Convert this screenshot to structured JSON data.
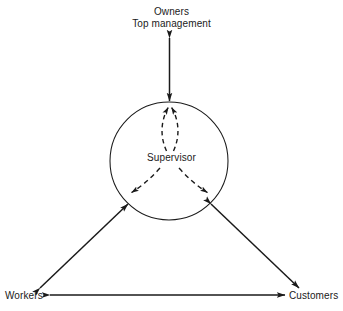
{
  "diagram": {
    "type": "relationship-diagram",
    "background_color": "#ffffff",
    "line_color": "#1a1a1a",
    "nodes": {
      "top": {
        "line1": "Owners",
        "line2": "Top management"
      },
      "center": {
        "label": "Supervisor"
      },
      "bottom_left": {
        "label": "Workers"
      },
      "bottom_right": {
        "label": "Customers"
      }
    },
    "connections": [
      {
        "name": "supervisor-to-top-management",
        "style": "solid",
        "arrows": "both",
        "from": "Supervisor",
        "to": "Owners / Top management"
      },
      {
        "name": "supervisor-to-workers",
        "style": "solid",
        "arrows": "both",
        "from": "Supervisor",
        "to": "Workers"
      },
      {
        "name": "supervisor-to-customers",
        "style": "solid",
        "arrows": "both",
        "from": "Supervisor",
        "to": "Customers"
      },
      {
        "name": "workers-to-customers",
        "style": "solid",
        "arrows": "both",
        "from": "Workers",
        "to": "Customers"
      },
      {
        "name": "supervisor-outflow-top",
        "style": "dashed",
        "arrows": "single",
        "from": "Supervisor",
        "to": "top of circle"
      },
      {
        "name": "supervisor-outflow-left",
        "style": "dashed",
        "arrows": "single",
        "from": "Supervisor",
        "to": "lower-left of circle"
      },
      {
        "name": "supervisor-outflow-right",
        "style": "dashed",
        "arrows": "single",
        "from": "Supervisor",
        "to": "lower-right of circle"
      }
    ]
  }
}
